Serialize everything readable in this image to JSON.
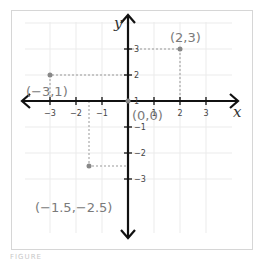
{
  "diagram": {
    "axes": {
      "x_label": "x",
      "y_label": "y",
      "x_ticks": [
        "−3",
        "−2",
        "−1",
        "1",
        "2",
        "3"
      ],
      "y_ticks": [
        "3",
        "2",
        "1",
        "−1",
        "−2",
        "−3"
      ],
      "range": [
        -3,
        3
      ]
    },
    "points": [
      {
        "label": "(2,3)",
        "x": 2,
        "y": 3
      },
      {
        "label": "(−3,1)",
        "x": -3,
        "y": 1
      },
      {
        "label": "(0,0)",
        "x": 0,
        "y": 0
      },
      {
        "label": "(−1.5,−2.5)",
        "x": -1.5,
        "y": -2.5
      }
    ],
    "colors": {
      "axis": "#111111",
      "grid": "#ebebeb",
      "point": "#888888",
      "label": "#7a7a7a",
      "guide": "#999999"
    }
  },
  "caption": "FIGURE"
}
